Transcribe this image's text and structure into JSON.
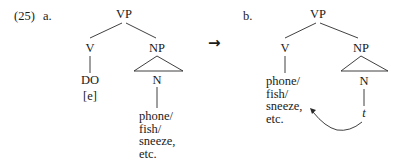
{
  "example_number": "(25)",
  "trees": [
    {
      "label": "a.",
      "root": "VP",
      "left_child": "V",
      "right_child": "NP",
      "v_terminal": [
        "DO",
        "[e]"
      ],
      "np_head": "N",
      "n_terminal": [
        "phone/",
        "fish/",
        "sneeze,",
        "etc."
      ]
    },
    {
      "label": "b.",
      "root": "VP",
      "left_child": "V",
      "right_child": "NP",
      "v_terminal": [
        "phone/",
        "fish/",
        "sneeze,",
        "etc."
      ],
      "np_head": "N",
      "n_terminal": [
        "t"
      ]
    }
  ],
  "transition_arrow": "→",
  "colors": {
    "ink": "#1a1a1a",
    "background": "#ffffff"
  }
}
